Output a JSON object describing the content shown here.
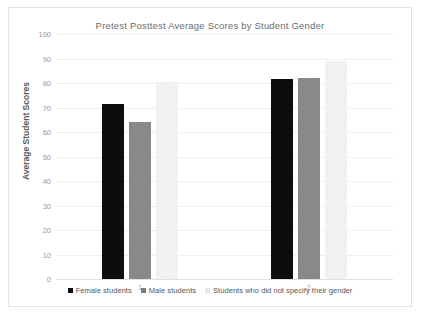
{
  "chart_data": {
    "type": "bar",
    "title": "Pretest Posttest Average Scores by Student Gender",
    "xlabel": "",
    "ylabel": "Average Student Scores",
    "categories": [
      "1",
      "2"
    ],
    "series": [
      {
        "name": "Female students",
        "values": [
          71.5,
          81.5
        ],
        "color": "#0d0d0d"
      },
      {
        "name": "Male students",
        "values": [
          64.0,
          82.0
        ],
        "color": "#808080"
      },
      {
        "name": "Students who did not specify their gender",
        "values": [
          80.5,
          89.0
        ],
        "color": "#e9e9e9"
      }
    ],
    "ylim": [
      0,
      100
    ],
    "ytick_labels": [
      "100",
      "90",
      "80",
      "70",
      "60",
      "50",
      "40",
      "30",
      "20",
      "10",
      "0"
    ],
    "ytick_values": [
      100,
      90,
      80,
      70,
      60,
      50,
      40,
      30,
      20,
      10,
      0
    ],
    "grid": true,
    "legend_position": "bottom"
  },
  "colors": {
    "frame_border": "#e3e3e3",
    "gridline": "#f0f0f0",
    "title_text": "#6d6d6d",
    "axis_text": "#9a9a9a"
  }
}
